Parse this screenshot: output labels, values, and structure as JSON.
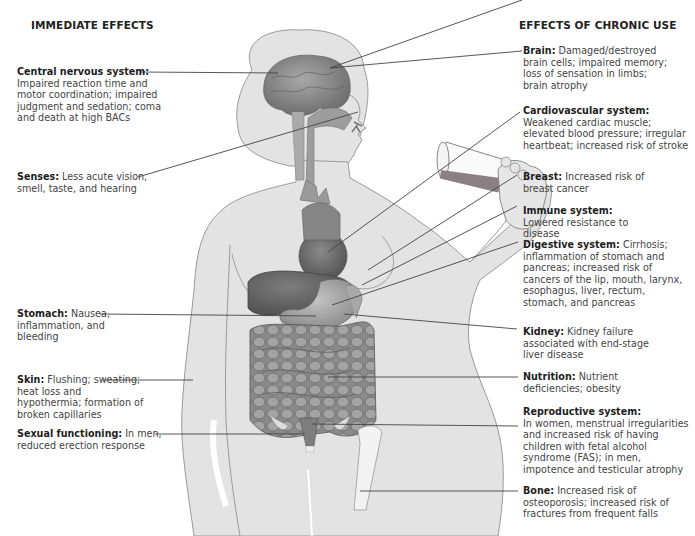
{
  "headings": {
    "immediate": "IMMEDIATE EFFECTS",
    "chronic": "EFFECTS OF CHRONIC USE"
  },
  "immediate_effects": [
    {
      "title": "Central nervous system:",
      "text": "Impaired reaction time and motor coordination; impaired judgment and sedation; coma and death at high BACs"
    },
    {
      "title": "Senses:",
      "text": "Less acute vision, smell, taste, and hearing"
    },
    {
      "title": "Stomach:",
      "text": "Nausea, inflammation, and bleeding"
    },
    {
      "title": "Skin:",
      "text": "Flushing; sweating; heat loss and hypothermia; formation of broken capillaries"
    },
    {
      "title": "Sexual functioning:",
      "text": "In men, reduced erection response"
    }
  ],
  "chronic_effects": [
    {
      "title": "Brain:",
      "text": "Damaged/destroyed brain cells; impaired memory; loss of sensation in limbs; brain atrophy"
    },
    {
      "title": "Cardiovascular system:",
      "text": "Weakened cardiac muscle; elevated blood pressure; irregular heartbeat; increased risk of stroke"
    },
    {
      "title": "Breast:",
      "text": "Increased risk of breast cancer"
    },
    {
      "title": "Immune system:",
      "text": "Lowered resistance to disease"
    },
    {
      "title": "Digestive system:",
      "text": "Cirrhosis; inflammation of stomach and pancreas; increased risk of cancers of the lip, mouth, larynx, esophagus, liver, rectum, stomach, and pancreas"
    },
    {
      "title": "Kidney:",
      "text": "Kidney failure associated with end-stage liver disease"
    },
    {
      "title": "Nutrition:",
      "text": "Nutrient deficiencies; obesity"
    },
    {
      "title": "Reproductive system:",
      "text": "In women, menstrual irregularities and increased risk of having children with fetal alcohol syndrome (FAS); in men, impotence and testicular atrophy"
    },
    {
      "title": "Bone:",
      "text": "Increased risk of osteoporosis; increased risk of fractures from frequent falls"
    }
  ],
  "colors": {
    "body_fill": "#e3e3e3",
    "body_outline": "#9a9a9a",
    "organ_dark": "#6e6e6e",
    "organ_mid": "#8c8c8c",
    "leader_line": "#444444"
  }
}
